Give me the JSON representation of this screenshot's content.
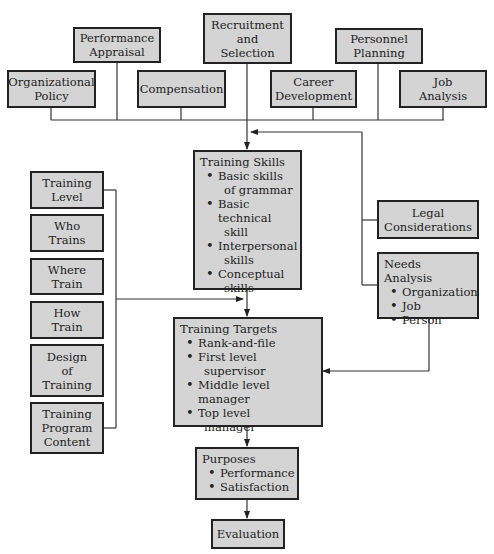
{
  "diagram": {
    "top_inputs": [
      {
        "id": "organizational-policy",
        "lines": [
          "Organizational",
          "Policy"
        ]
      },
      {
        "id": "performance-appraisal",
        "lines": [
          "Performance",
          "Appraisal"
        ]
      },
      {
        "id": "compensation",
        "lines": [
          "Compensation"
        ]
      },
      {
        "id": "recruitment-selection",
        "lines": [
          "Recruitment",
          "and",
          "Selection"
        ]
      },
      {
        "id": "career-development",
        "lines": [
          "Career",
          "Development"
        ]
      },
      {
        "id": "personnel-planning",
        "lines": [
          "Personnel",
          "Planning"
        ]
      },
      {
        "id": "job-analysis",
        "lines": [
          "Job",
          "Analysis"
        ]
      }
    ],
    "left_inputs": [
      {
        "id": "training-level",
        "lines": [
          "Training",
          "Level"
        ]
      },
      {
        "id": "who-trains",
        "lines": [
          "Who",
          "Trains"
        ]
      },
      {
        "id": "where-train",
        "lines": [
          "Where",
          "Train"
        ]
      },
      {
        "id": "how-train",
        "lines": [
          "How",
          "Train"
        ]
      },
      {
        "id": "design-of-training",
        "lines": [
          "Design",
          "of",
          "Training"
        ]
      },
      {
        "id": "training-program-content",
        "lines": [
          "Training",
          "Program",
          "Content"
        ]
      }
    ],
    "right_inputs": {
      "legal": {
        "lines": [
          "Legal",
          "Considerations"
        ]
      },
      "needs_analysis": {
        "title": "Needs Analysis",
        "items": [
          "Organization",
          "Job",
          "Person"
        ]
      }
    },
    "training_skills": {
      "title": "Training Skills",
      "items": [
        [
          "Basic skills",
          "of grammar"
        ],
        [
          "Basic technical",
          "skill"
        ],
        [
          "Interpersonal",
          "skills"
        ],
        [
          "Conceptual",
          "skills"
        ]
      ]
    },
    "training_targets": {
      "title": "Training Targets",
      "items": [
        [
          "Rank-and-file"
        ],
        [
          "First level",
          "supervisor"
        ],
        [
          "Middle level manager"
        ],
        [
          "Top level",
          "manager"
        ]
      ]
    },
    "purposes": {
      "title": "Purposes",
      "items": [
        "Performance",
        "Satisfaction"
      ]
    },
    "evaluation": {
      "label": "Evaluation"
    },
    "colors": {
      "box_fill": "#d4d4d4",
      "stroke": "#222222",
      "background": "#ffffff"
    }
  }
}
